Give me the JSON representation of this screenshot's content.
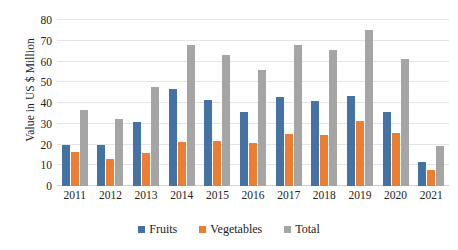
{
  "chart_data": {
    "type": "bar",
    "title": "",
    "subtitle": "",
    "xlabel": "",
    "ylabel": "Value in US $ Million",
    "categories": [
      "2011",
      "2012",
      "2013",
      "2014",
      "2015",
      "2016",
      "2017",
      "2018",
      "2019",
      "2020",
      "2021"
    ],
    "series": [
      {
        "name": "Fruits",
        "color": "#4472a4",
        "values": [
          20.0,
          20.0,
          31.0,
          46.7,
          41.5,
          35.5,
          43.0,
          41.0,
          43.5,
          35.5,
          11.8
        ]
      },
      {
        "name": "Vegetables",
        "color": "#ed7d31",
        "values": [
          16.5,
          13.0,
          16.0,
          21.0,
          21.5,
          20.5,
          25.0,
          24.5,
          31.5,
          25.5,
          7.5
        ]
      },
      {
        "name": "Total",
        "color": "#a5a5a5",
        "values": [
          36.5,
          32.5,
          47.5,
          68.0,
          63.0,
          56.0,
          68.0,
          65.5,
          75.0,
          61.0,
          19.5
        ]
      }
    ],
    "ylim": [
      0,
      80
    ],
    "y_ticks": [
      0,
      10,
      20,
      30,
      40,
      50,
      60,
      70,
      80
    ],
    "y_tick_labels": [
      "0",
      "10",
      "20",
      "30",
      "40",
      "50",
      "60",
      "70",
      "80"
    ],
    "grid": true,
    "grid_axis": "y",
    "legend_position": "bottom",
    "legend_entries": [
      "Fruits",
      "Vegetables",
      "Total"
    ]
  },
  "axes": {
    "y_title": "Value in US $ Million"
  }
}
